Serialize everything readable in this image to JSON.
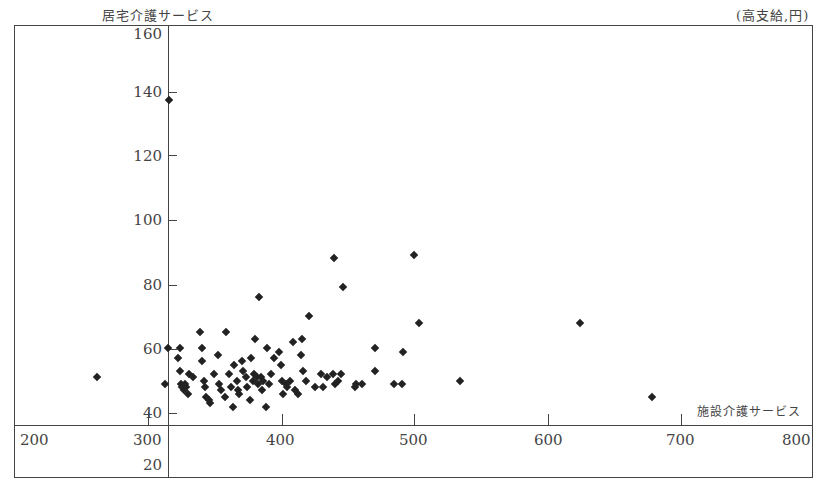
{
  "chart_data": {
    "type": "scatter",
    "title": "",
    "ylabel": "居宅介護サービス",
    "xlabel": "施設介護サービス",
    "unit_note": "(高支給,円)",
    "y_ticks": [
      "160",
      "140",
      "120",
      "100",
      "80",
      "60",
      "40",
      "20"
    ],
    "x_ticks": [
      "200",
      "300",
      "400",
      "500",
      "600",
      "700",
      "800"
    ],
    "xlim": [
      200,
      800
    ],
    "ylim": [
      20,
      160
    ],
    "grid": false,
    "legend": null,
    "points": [
      {
        "x": 315,
        "y": 137
      },
      {
        "x": 261,
        "y": 51
      },
      {
        "x": 314,
        "y": 60
      },
      {
        "x": 312,
        "y": 49
      },
      {
        "x": 323,
        "y": 60
      },
      {
        "x": 322,
        "y": 57
      },
      {
        "x": 323,
        "y": 53
      },
      {
        "x": 324,
        "y": 49
      },
      {
        "x": 325,
        "y": 48
      },
      {
        "x": 326,
        "y": 47
      },
      {
        "x": 327,
        "y": 49
      },
      {
        "x": 328,
        "y": 48
      },
      {
        "x": 329,
        "y": 46
      },
      {
        "x": 330,
        "y": 52
      },
      {
        "x": 333,
        "y": 51
      },
      {
        "x": 338,
        "y": 65
      },
      {
        "x": 340,
        "y": 60
      },
      {
        "x": 340,
        "y": 56
      },
      {
        "x": 341,
        "y": 50
      },
      {
        "x": 342,
        "y": 48
      },
      {
        "x": 343,
        "y": 45
      },
      {
        "x": 345,
        "y": 44
      },
      {
        "x": 346,
        "y": 43
      },
      {
        "x": 349,
        "y": 52
      },
      {
        "x": 352,
        "y": 58
      },
      {
        "x": 353,
        "y": 49
      },
      {
        "x": 354,
        "y": 47
      },
      {
        "x": 357,
        "y": 45
      },
      {
        "x": 358,
        "y": 65
      },
      {
        "x": 360,
        "y": 52
      },
      {
        "x": 362,
        "y": 48
      },
      {
        "x": 363,
        "y": 42
      },
      {
        "x": 364,
        "y": 55
      },
      {
        "x": 366,
        "y": 50
      },
      {
        "x": 367,
        "y": 47
      },
      {
        "x": 368,
        "y": 46
      },
      {
        "x": 370,
        "y": 56
      },
      {
        "x": 371,
        "y": 53
      },
      {
        "x": 373,
        "y": 51
      },
      {
        "x": 374,
        "y": 48
      },
      {
        "x": 376,
        "y": 44
      },
      {
        "x": 377,
        "y": 57
      },
      {
        "x": 378,
        "y": 50
      },
      {
        "x": 379,
        "y": 52
      },
      {
        "x": 380,
        "y": 63
      },
      {
        "x": 381,
        "y": 51
      },
      {
        "x": 382,
        "y": 49
      },
      {
        "x": 383,
        "y": 76
      },
      {
        "x": 384,
        "y": 51
      },
      {
        "x": 385,
        "y": 47
      },
      {
        "x": 386,
        "y": 50
      },
      {
        "x": 388,
        "y": 42
      },
      {
        "x": 389,
        "y": 60
      },
      {
        "x": 390,
        "y": 49
      },
      {
        "x": 392,
        "y": 52
      },
      {
        "x": 394,
        "y": 57
      },
      {
        "x": 398,
        "y": 59
      },
      {
        "x": 399,
        "y": 55
      },
      {
        "x": 400,
        "y": 50
      },
      {
        "x": 401,
        "y": 46
      },
      {
        "x": 403,
        "y": 49
      },
      {
        "x": 404,
        "y": 48
      },
      {
        "x": 406,
        "y": 50
      },
      {
        "x": 408,
        "y": 62
      },
      {
        "x": 410,
        "y": 47
      },
      {
        "x": 412,
        "y": 46
      },
      {
        "x": 414,
        "y": 58
      },
      {
        "x": 415,
        "y": 63
      },
      {
        "x": 416,
        "y": 53
      },
      {
        "x": 418,
        "y": 50
      },
      {
        "x": 420,
        "y": 70
      },
      {
        "x": 425,
        "y": 48
      },
      {
        "x": 429,
        "y": 52
      },
      {
        "x": 431,
        "y": 48
      },
      {
        "x": 434,
        "y": 51
      },
      {
        "x": 438,
        "y": 52
      },
      {
        "x": 439,
        "y": 88
      },
      {
        "x": 440,
        "y": 49
      },
      {
        "x": 442,
        "y": 50
      },
      {
        "x": 444,
        "y": 52
      },
      {
        "x": 446,
        "y": 79
      },
      {
        "x": 455,
        "y": 48
      },
      {
        "x": 456,
        "y": 49
      },
      {
        "x": 460,
        "y": 49
      },
      {
        "x": 470,
        "y": 60
      },
      {
        "x": 470,
        "y": 53
      },
      {
        "x": 484,
        "y": 49
      },
      {
        "x": 490,
        "y": 49
      },
      {
        "x": 491,
        "y": 59
      },
      {
        "x": 499,
        "y": 89
      },
      {
        "x": 503,
        "y": 68
      },
      {
        "x": 534,
        "y": 50
      },
      {
        "x": 624,
        "y": 68
      },
      {
        "x": 678,
        "y": 45
      }
    ]
  },
  "labels": {
    "y_axis_title": "居宅介護サービス",
    "x_axis_title": "施設介護サービス",
    "unit_note": "(高支給,円)"
  }
}
